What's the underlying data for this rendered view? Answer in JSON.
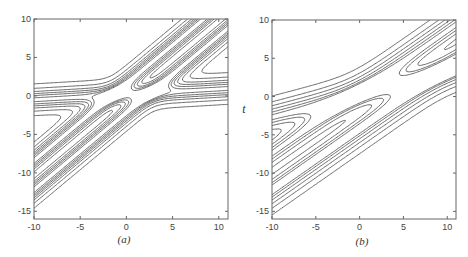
{
  "chart_data": [
    {
      "type": "contour",
      "caption": "(a)",
      "xlabel": "",
      "ylabel": "",
      "xlim": [
        -10,
        11
      ],
      "ylim": [
        -16,
        10
      ],
      "xticks": [
        -10,
        -5,
        0,
        5,
        10
      ],
      "yticks": [
        10,
        5,
        0,
        -5,
        -10,
        -15
      ],
      "grid": false,
      "description": "Contour plot of an X-shaped two-soliton interaction: a steep double-ridge band along t≈x-1 crossing a nearly horizontal band near t≈0.",
      "solitons": [
        {
          "slope": 1.0,
          "offset": -2.2,
          "width": 1.1,
          "amp": 1.0
        },
        {
          "slope": 1.0,
          "offset": 1.6,
          "width": 1.1,
          "amp": 1.0
        },
        {
          "slope": 0.07,
          "offset": 0.2,
          "width": 1.0,
          "amp": 0.8
        }
      ],
      "levels": [
        0.05,
        0.15,
        0.3,
        0.45,
        0.6,
        0.75,
        0.9
      ]
    },
    {
      "type": "contour",
      "caption": "(b)",
      "xlabel": "",
      "ylabel": "t",
      "xlim": [
        -10,
        11
      ],
      "ylim": [
        -16,
        10
      ],
      "xticks": [
        -10,
        -5,
        0,
        5,
        10
      ],
      "yticks": [
        10,
        5,
        0,
        -5,
        -10,
        -15
      ],
      "grid": false,
      "description": "Contour plot of two crossing soliton bands with different slopes (≈0.8 and ≈0.3) intersecting near the origin.",
      "solitons": [
        {
          "slope": 0.8,
          "offset": -4.2,
          "width": 1.5,
          "amp": 1.0
        },
        {
          "slope": 0.8,
          "offset": 0.6,
          "width": 1.4,
          "amp": 0.9
        },
        {
          "slope": 0.3,
          "offset": 0.3,
          "width": 1.3,
          "amp": 0.9
        }
      ],
      "levels": [
        0.05,
        0.15,
        0.3,
        0.5,
        0.7,
        0.85
      ]
    }
  ],
  "panels": [
    {
      "caption": "(a)",
      "ylabel": ""
    },
    {
      "caption": "(b)",
      "ylabel": "t"
    }
  ]
}
